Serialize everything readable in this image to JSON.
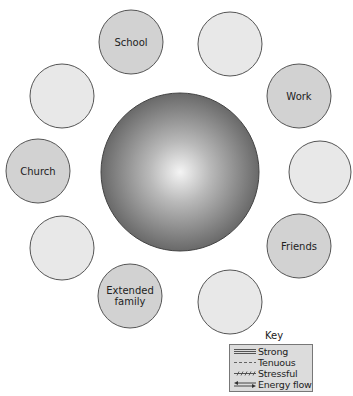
{
  "diagram": {
    "center": {
      "label": "",
      "cx": 180,
      "cy": 172,
      "r": 79
    },
    "nodes": [
      {
        "id": "school",
        "label": "School",
        "label_lines": [
          "School"
        ],
        "cx": 131,
        "cy": 42,
        "r": 32,
        "filled": true
      },
      {
        "id": "blank-top-right",
        "label": "",
        "label_lines": [],
        "cx": 230,
        "cy": 44,
        "r": 32,
        "filled": false
      },
      {
        "id": "work",
        "label": "Work",
        "label_lines": [
          "Work"
        ],
        "cx": 299,
        "cy": 96,
        "r": 32,
        "filled": true
      },
      {
        "id": "blank-right",
        "label": "",
        "label_lines": [],
        "cx": 320,
        "cy": 172,
        "r": 31,
        "filled": false
      },
      {
        "id": "friends",
        "label": "Friends",
        "label_lines": [
          "Friends"
        ],
        "cx": 299,
        "cy": 246,
        "r": 32,
        "filled": true
      },
      {
        "id": "blank-bottom-right",
        "label": "",
        "label_lines": [],
        "cx": 230,
        "cy": 302,
        "r": 32,
        "filled": false
      },
      {
        "id": "extended-family",
        "label": "Extended family",
        "label_lines": [
          "Extended",
          "family"
        ],
        "cx": 130,
        "cy": 296,
        "r": 32,
        "filled": true
      },
      {
        "id": "blank-bottom-left",
        "label": "",
        "label_lines": [],
        "cx": 62,
        "cy": 248,
        "r": 32,
        "filled": false
      },
      {
        "id": "church",
        "label": "Church",
        "label_lines": [
          "Church"
        ],
        "cx": 38,
        "cy": 171,
        "r": 32,
        "filled": true
      },
      {
        "id": "blank-top-left",
        "label": "",
        "label_lines": [],
        "cx": 62,
        "cy": 96,
        "r": 32,
        "filled": false
      }
    ],
    "colors": {
      "filled_node": "#d2d2d2",
      "blank_node": "#e8e8e8",
      "node_stroke": "#555555",
      "center_light": "#f2f2f2",
      "center_dark": "#5a5a5a"
    }
  },
  "key": {
    "title": "Key",
    "items": [
      {
        "label": "Strong",
        "line_style": "triple-solid"
      },
      {
        "label": "Tenuous",
        "line_style": "dashed"
      },
      {
        "label": "Stressful",
        "line_style": "hatched"
      },
      {
        "label": "Energy flow",
        "line_style": "double-arrow"
      }
    ]
  }
}
